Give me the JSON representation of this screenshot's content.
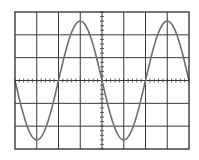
{
  "chart_data": {
    "type": "line",
    "title": "",
    "xlabel": "",
    "ylabel": "",
    "grid": true,
    "grid_divisions": {
      "x": 8,
      "y": 6
    },
    "minor_ticks_per_division": 5,
    "xlim": [
      0,
      8
    ],
    "ylim": [
      -3,
      3
    ],
    "series": [
      {
        "name": "sine-wave",
        "function": "y = -2.6 * sin(2*pi*x/4)",
        "amplitude_divisions": 2.6,
        "period_divisions": 4,
        "x": [
          0,
          1,
          2,
          3,
          4,
          5,
          6,
          7,
          8
        ],
        "values": [
          0,
          -2.6,
          0,
          2.6,
          0,
          -2.6,
          0,
          2.6,
          0
        ]
      }
    ]
  },
  "style": {
    "background": "#ffffff",
    "grid_color": "#3a3a3a",
    "trace_color": "#6e6e6e"
  },
  "geometry": {
    "left": 15,
    "top": 12,
    "right": 189,
    "bottom": 149
  }
}
